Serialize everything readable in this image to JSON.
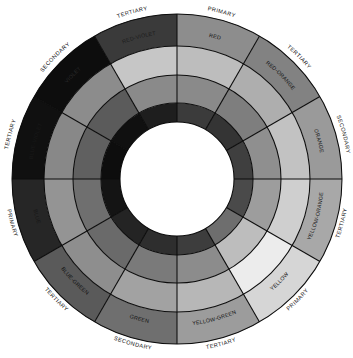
{
  "figure": {
    "name": "color-wheel",
    "rendering": "grayscale",
    "center": {
      "x": 177,
      "y": 179
    },
    "radii": {
      "outer": 165,
      "label_ring_inner": 133,
      "ring2_inner": 104,
      "ring3_inner": 76,
      "hub": 57
    },
    "sector_count": 12,
    "start_angle_deg": -90,
    "ring_names": [
      "hue-label-ring",
      "tint-ring",
      "tone-ring",
      "shade-ring"
    ],
    "hub_color": "#ffffff",
    "line_color": "#0c0c0c",
    "background": "#ffffff"
  },
  "sectors": [
    {
      "hue": "RED",
      "classification": "PRIMARY",
      "label_fill": "#111111",
      "class_fill": "#111111",
      "rings": [
        "#8d8d8d",
        "#bdbdbd",
        "#8a8a8a",
        "#3b3b3b"
      ]
    },
    {
      "hue": "RED-ORANGE",
      "classification": "TERTIARY",
      "label_fill": "#111111",
      "class_fill": "#111111",
      "rings": [
        "#828282",
        "#aeaeae",
        "#7e7e7e",
        "#343434"
      ]
    },
    {
      "hue": "ORANGE",
      "classification": "SECONDARY",
      "label_fill": "#111111",
      "class_fill": "#111111",
      "rings": [
        "#9a9a9a",
        "#c2c2c2",
        "#8f8f8f",
        "#3f3f3f"
      ]
    },
    {
      "hue": "YELLOW-ORANGE",
      "classification": "TERTIARY",
      "label_fill": "#111111",
      "class_fill": "#111111",
      "rings": [
        "#a8a8a8",
        "#cfcfcf",
        "#9d9d9d",
        "#4a4a4a"
      ]
    },
    {
      "hue": "YELLOW",
      "classification": "PRIMARY",
      "label_fill": "#111111",
      "class_fill": "#111111",
      "rings": [
        "#d6d6d6",
        "#ececec",
        "#bdbdbd",
        "#6e6e6e"
      ]
    },
    {
      "hue": "YELLOW-GREEN",
      "classification": "TERTIARY",
      "label_fill": "#111111",
      "class_fill": "#111111",
      "rings": [
        "#9c9c9c",
        "#b7b7b7",
        "#8c8c8c",
        "#3d3d3d"
      ]
    },
    {
      "hue": "GREEN",
      "classification": "SECONDARY",
      "label_fill": "#111111",
      "class_fill": "#111111",
      "rings": [
        "#6f6f6f",
        "#a2a2a2",
        "#7a7a7a",
        "#2e2e2e"
      ]
    },
    {
      "hue": "BLUE-GREEN",
      "classification": "TERTIARY",
      "label_fill": "#111111",
      "class_fill": "#111111",
      "rings": [
        "#5a5a5a",
        "#8e8e8e",
        "#6a6a6a",
        "#242424"
      ]
    },
    {
      "hue": "BLUE",
      "classification": "PRIMARY",
      "label_fill": "#161616",
      "class_fill": "#111111",
      "rings": [
        "#262626",
        "#949494",
        "#6f6f6f",
        "#141414"
      ]
    },
    {
      "hue": "BLUE-VIOLET",
      "classification": "TERTIARY",
      "label_fill": "#191919",
      "class_fill": "#111111",
      "rings": [
        "#101010",
        "#888888",
        "#606060",
        "#0d0d0d"
      ]
    },
    {
      "hue": "VIOLET",
      "classification": "SECONDARY",
      "label_fill": "#2a2a2a",
      "class_fill": "#111111",
      "rings": [
        "#0d0d0d",
        "#8c8c8c",
        "#5b5b5b",
        "#101010"
      ]
    },
    {
      "hue": "RED-VIOLET",
      "classification": "TERTIARY",
      "label_fill": "#1c1c1c",
      "class_fill": "#111111",
      "rings": [
        "#3a3a3a",
        "#c6c6c6",
        "#8a8a8a",
        "#1e1e1e"
      ]
    }
  ]
}
